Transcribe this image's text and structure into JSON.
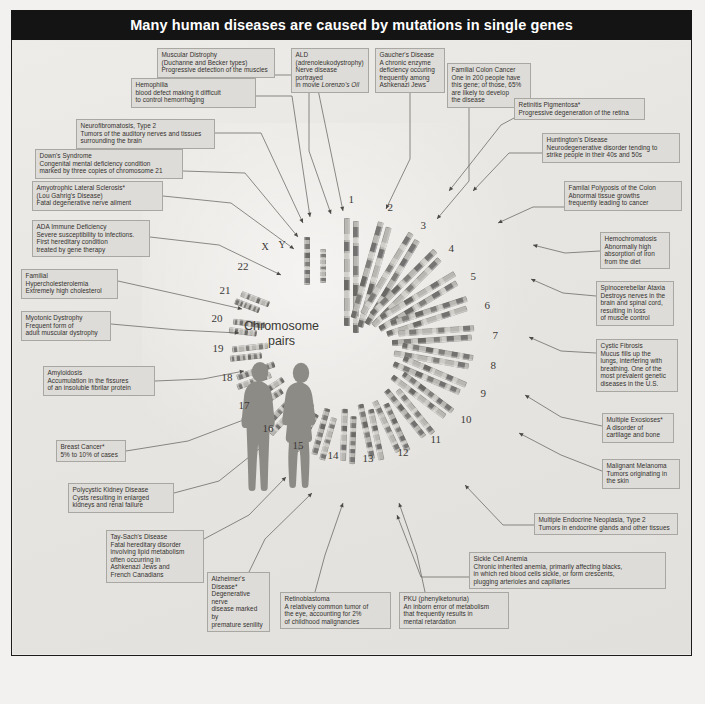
{
  "title": "Many human diseases are caused by mutations in single genes",
  "center": {
    "line1": "Chromosome",
    "line2": "pairs"
  },
  "chromosome_numbers": [
    "1",
    "2",
    "3",
    "4",
    "5",
    "6",
    "7",
    "8",
    "9",
    "10",
    "11",
    "12",
    "13",
    "14",
    "15",
    "16",
    "17",
    "18",
    "19",
    "20",
    "21",
    "22",
    "X",
    "Y"
  ],
  "colors": {
    "title_bar": "#141414",
    "title_text": "#ffffff",
    "label_fill": "#dedcd8",
    "label_border": "#a9a7a2",
    "background": "#eceae6",
    "chromosome_body": "#b9b7b2",
    "silhouette": "#8d8b86",
    "frame": "#1c1c1c"
  },
  "labels": [
    {
      "id": "muscular-dystrophy",
      "name": "Muscular Distrophy",
      "desc": [
        "(Duchanne and Becker types)",
        "Progressive detection of the muscles"
      ]
    },
    {
      "id": "ald",
      "name": "ALD",
      "desc": [
        "(adrenoleukodystrophy)",
        "Nerve disease portrayed",
        "in movie Lorenzo's Oil"
      ]
    },
    {
      "id": "gauchers-disease",
      "name": "Gaucher's Disease",
      "desc": [
        "A chronic enzyme",
        "deficiency occuring",
        "frequently among",
        "Ashkenazi Jews"
      ]
    },
    {
      "id": "familial-colon-cancer",
      "name": "Familial Colon Cancer",
      "desc": [
        "One in 200 people have",
        "this gene; of those, 65%",
        "are likely to develop",
        "the disease"
      ]
    },
    {
      "id": "hemophilia",
      "name": "Hemophilia",
      "desc": [
        "blood defect making it difficult",
        "to control hemorrhaging"
      ]
    },
    {
      "id": "retinitis-pigmentosa",
      "name": "Retinitis Pigmentosa*",
      "desc": [
        "Progressive degeneration of the retina"
      ]
    },
    {
      "id": "neurofibromatosis-type-2",
      "name": "Neurofibromatosis, Type 2",
      "desc": [
        "Tumors of the auditory nerves and tissues",
        "surrounding the brain"
      ]
    },
    {
      "id": "huntingtons-disease",
      "name": "Huntington's Disease",
      "desc": [
        "Neurodegenerative disorder tending to",
        "strike people in their 40s and 50s"
      ]
    },
    {
      "id": "downs-syndrome",
      "name": "Down's Syndrome",
      "desc": [
        "Congenital mental deficiency condition",
        "marked by three copies of chromosome 21"
      ]
    },
    {
      "id": "als",
      "name": "Amyotrophic Lateral Sclerosis*",
      "desc": [
        "(Lou Gahrig's Disease)",
        "Fatal degenerative nerve ailment"
      ]
    },
    {
      "id": "familial-polyposis",
      "name": "Familal Polyposis of the Colon",
      "desc": [
        "Abnormal tissue growths",
        "frequently leading to cancer"
      ]
    },
    {
      "id": "ada-immune-deficiency",
      "name": "ADA Immune Deficiency",
      "desc": [
        "Severe susceptibility to infections.",
        "First hereditary condition",
        "treated by gene therapy"
      ]
    },
    {
      "id": "hemochromatosis",
      "name": "Hemochromatosis",
      "desc": [
        "Abnormally high",
        "absorption of iron",
        "from the diet"
      ]
    },
    {
      "id": "familial-hypercholesterolemia",
      "name": "Familial",
      "desc": [
        "Hypercholesterolemia",
        "Extremely high cholesterol"
      ]
    },
    {
      "id": "spinocerebellar-ataxia",
      "name": "Spinocerebellar Ataxia",
      "desc": [
        "Destroys nerves in the",
        "brain and spinal cord,",
        "resulting in loss",
        "of muscle control"
      ]
    },
    {
      "id": "myotonic-dystrophy",
      "name": "Myotonic Dystrophy",
      "desc": [
        "Frequent form of",
        "adult muscular dystrophy"
      ]
    },
    {
      "id": "cystic-fibrosis",
      "name": "Cystic Fibrosis",
      "desc": [
        "Mucus fills up the",
        "lungs, interfering with",
        "breathing. One of the",
        "most prevalent genetic",
        "diseases in the U.S."
      ]
    },
    {
      "id": "amyloidosis",
      "name": "Amyloidosis",
      "desc": [
        "Accumulation in the fissures",
        "of an insoluble fibrilar protein"
      ]
    },
    {
      "id": "multiple-exostoses",
      "name": "Multiple Exosioses*",
      "desc": [
        "A disorder of",
        "cartilage and bone"
      ]
    },
    {
      "id": "breast-cancer",
      "name": "Breast Cancer*",
      "desc": [
        "5% to 10% of cases"
      ]
    },
    {
      "id": "malignant-melanoma",
      "name": "Malignant Melanoma",
      "desc": [
        "Tumors originating in",
        "the skin"
      ]
    },
    {
      "id": "polycystic-kidney-disease",
      "name": "Polycystic Kidney Disease",
      "desc": [
        "Cysts resulting in enlarged",
        "kidneys and renal failure"
      ]
    },
    {
      "id": "men-type-2",
      "name": "Multiple Endocrine Neoplasia, Type 2",
      "desc": [
        "Tumors in endocrine glands and other tissues"
      ]
    },
    {
      "id": "tay-sachs-disease",
      "name": "Tay-Sach's Disease",
      "desc": [
        "Fatal hereditary disorder",
        "involving lipid metabolism",
        "often occurring in",
        "Ashkenazi Jews and",
        "French Canadians"
      ]
    },
    {
      "id": "sickle-cell-anemia",
      "name": "Sickle Cell Anemia",
      "desc": [
        "Chronic inherited anemia, primarily affecting blacks,",
        "in which red blood cells sickle, or form crescents,",
        "plugging arterioles and capillaries"
      ]
    },
    {
      "id": "alzheimers-disease",
      "name": "Alzheimer's",
      "desc": [
        "Disease*",
        "Degenerative nerve",
        "disease marked by",
        "premature senility"
      ]
    },
    {
      "id": "retinoblastoma",
      "name": "Retinoblastoma",
      "desc": [
        "A relatively common tumor of",
        "the eye, accounting for 2%",
        "of childhood malignancies"
      ]
    },
    {
      "id": "pku",
      "name": "PKU (phenylketonuria)",
      "desc": [
        "An inborn error of metabolism",
        "that frequently results in",
        "mental retardation"
      ]
    }
  ]
}
